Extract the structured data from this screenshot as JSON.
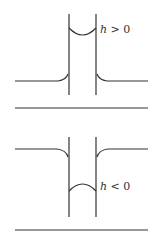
{
  "panels": [
    {
      "name": "capillary-rise",
      "label_var": "h",
      "label_rel": "> 0"
    },
    {
      "name": "capillary-depression",
      "label_var": "h",
      "label_rel": "< 0"
    }
  ],
  "colors": {
    "stroke": "#333333",
    "background": "#ffffff"
  }
}
